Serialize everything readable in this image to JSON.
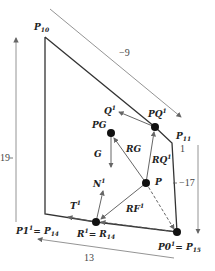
{
  "diagram": {
    "nodes": {
      "PG": {
        "label": "PG",
        "x": 111,
        "y": 133
      },
      "PQ1": {
        "label": "PQ",
        "sup": "1",
        "x": 155,
        "y": 127
      },
      "P": {
        "label": "P",
        "x": 146,
        "y": 183
      },
      "R1": {
        "label": "R",
        "sup": "1",
        "eq": "= R",
        "eq_sub": "14",
        "x": 96,
        "y": 222
      },
      "P01": {
        "label": "P0",
        "sup": "1",
        "eq": "= P",
        "eq_sub": "15",
        "x": 177,
        "y": 232
      }
    },
    "vertices": {
      "P10": {
        "label": "P",
        "sub": "10"
      },
      "P11": {
        "label": "P",
        "sub": "11"
      },
      "P1_1": {
        "label": "P1",
        "sup": "1",
        "eq": "= P",
        "eq_sub": "14"
      }
    },
    "vectors": {
      "Q1": {
        "label": "Q",
        "sup": "1"
      },
      "G": {
        "label": "G"
      },
      "RG": {
        "label": "RG"
      },
      "RQ1": {
        "label": "RQ",
        "sup": "1"
      },
      "RF1": {
        "label": "RF",
        "sup": "1"
      },
      "N1": {
        "label": "N",
        "sup": "1"
      },
      "T1": {
        "label": "T",
        "sup": "1"
      }
    },
    "dimensions": {
      "top": "−9",
      "left": "19",
      "right": "−17",
      "right_small": "1",
      "bottom": "13"
    },
    "colors": {
      "outline": "#333333",
      "arrow": "#777777",
      "node": "#111111"
    }
  }
}
